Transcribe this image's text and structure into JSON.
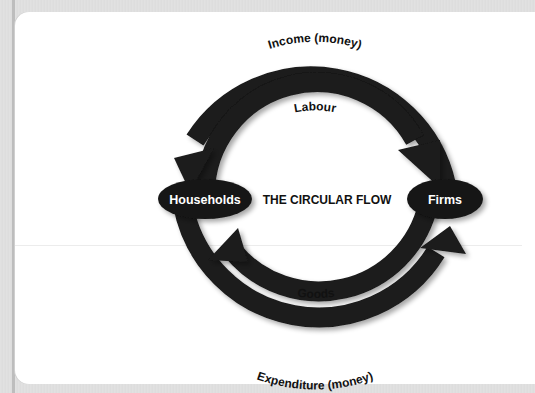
{
  "diagram": {
    "title": "THE CIRCULAR FLOW",
    "nodes": [
      {
        "id": "households",
        "label": "Households"
      },
      {
        "id": "firms",
        "label": "Firms"
      }
    ],
    "flows": [
      {
        "label": "Income (money)",
        "from": "Firms",
        "to": "Households",
        "ring": "outer-top"
      },
      {
        "label": "Labour",
        "from": "Households",
        "to": "Firms",
        "ring": "inner-top"
      },
      {
        "label": "Goods",
        "from": "Firms",
        "to": "Households",
        "ring": "inner-bottom"
      },
      {
        "label": "Expenditure (money)",
        "from": "Households",
        "to": "Firms",
        "ring": "outer-bottom"
      }
    ],
    "colors": {
      "arrow": "#1a1a1a",
      "node_fill": "#151515",
      "node_text": "#ffffff",
      "text": "#111111",
      "background": "#ffffff"
    }
  }
}
